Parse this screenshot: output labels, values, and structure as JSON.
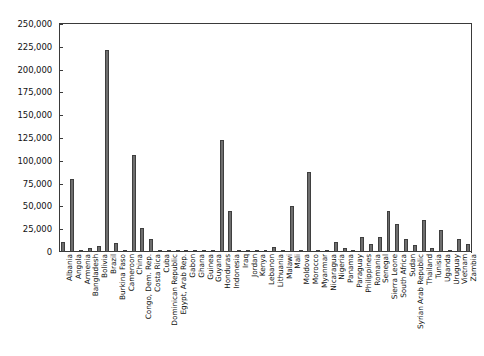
{
  "chart_data": {
    "type": "bar",
    "title": "",
    "subtitle": "",
    "xlabel": "",
    "ylabel": "",
    "ylim": [
      0,
      250000
    ],
    "grid": false,
    "legend": null,
    "ytick_labels": [
      "0",
      "25,000",
      "50,000",
      "75,000",
      "100,000",
      "125,000",
      "150,000",
      "175,000",
      "200,000",
      "225,000",
      "250,000"
    ],
    "ytick_values": [
      0,
      25000,
      50000,
      75000,
      100000,
      125000,
      150000,
      175000,
      200000,
      225000,
      250000
    ],
    "bar_color": "#6e6e6e",
    "bar_edge_color": "#3f3f3f",
    "axis_color": "#3a3a3a",
    "categories": [
      "Albania",
      "Angola",
      "Armenia",
      "Bangladesh",
      "Bolivia",
      "Brazil",
      "Burkina Faso",
      "Cameroon",
      "China",
      "Congo, Dem. Rep.",
      "Costa Rica",
      "Cuba",
      "Dominican Republic",
      "Egypt, Arab Rep.",
      "Gabon",
      "Ghana",
      "Guinea",
      "Guyana",
      "Honduras",
      "Indonesia",
      "Iraq",
      "Jordan",
      "Kenya",
      "Lebanon",
      "Lithuania",
      "Malawi",
      "Mali",
      "Moldova",
      "Morocco",
      "Myanmar",
      "Nicaragua",
      "Nigeria",
      "Panama",
      "Paraguay",
      "Philippines",
      "Romania",
      "Senegal",
      "Sierra Leone",
      "South Africa",
      "Sudan",
      "Syrian Arab Republic",
      "Thailand",
      "Tunisia",
      "Uganda",
      "Uruguay",
      "Vietnam",
      "Zambia"
    ],
    "values": [
      11000,
      80000,
      1500,
      4000,
      7000,
      221000,
      9500,
      1200,
      106000,
      26000,
      14000,
      1000,
      2500,
      2000,
      1000,
      1000,
      800,
      1200,
      123000,
      45000,
      1200,
      2500,
      2000,
      1500,
      6000,
      1000,
      50000,
      2500,
      88000,
      1000,
      1500,
      11000,
      4000,
      2500,
      16000,
      9000,
      17000,
      45000,
      31000,
      14000,
      8000,
      35000,
      4000,
      24000,
      1000,
      14000,
      9000
    ]
  }
}
